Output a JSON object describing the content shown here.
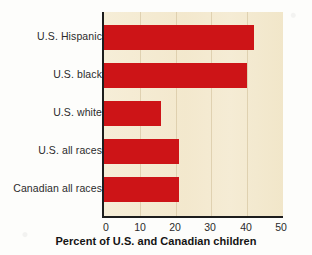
{
  "chart_data": {
    "type": "bar",
    "orientation": "horizontal",
    "title": "",
    "xlabel": "Percent of U.S. and Canadian children",
    "ylabel": "",
    "categories": [
      "U.S. Hispanic",
      "U.S. black",
      "U.S. white",
      "U.S. all races",
      "Canadian all races"
    ],
    "values": [
      42,
      40,
      16,
      21,
      21
    ],
    "xlim": [
      0,
      50
    ],
    "xticks": [
      0,
      10,
      20,
      30,
      40,
      50
    ],
    "xtick_labels": [
      "0",
      "10",
      "20",
      "30",
      "40",
      "50"
    ],
    "grid": true,
    "legend": null,
    "series": [
      {
        "name": "Percent of children",
        "color": "#cd1417",
        "values": [
          42,
          40,
          16,
          21,
          21
        ]
      }
    ]
  },
  "colors": {
    "bar": "#cd1417",
    "plot_background": "#f4ead0",
    "figure_background": "#fdfdfb",
    "axis": "#1d1d1d",
    "text": "#2b2b2b"
  }
}
